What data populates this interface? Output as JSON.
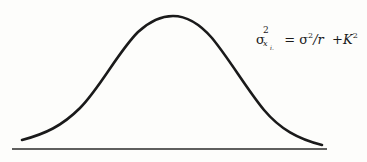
{
  "figure": {
    "curve_color": "#1a1a1a",
    "baseline_color": "#2a2a2a",
    "curve": {
      "start": [
        22,
        140
      ],
      "peak": [
        173,
        16
      ],
      "end": [
        322,
        145
      ]
    },
    "baseline": {
      "x1": 12,
      "x2": 327,
      "y": 149
    }
  },
  "formula": {
    "lhs_symbol": "σ",
    "lhs_sup": "2",
    "lhs_sub": "x",
    "lhs_subsub": "i.",
    "equals": "=",
    "rhs_sigma": "σ",
    "rhs_sigma_sup": "2",
    "rhs_div": "/r",
    "plus": "+",
    "k": "K",
    "k_sup": "2"
  }
}
